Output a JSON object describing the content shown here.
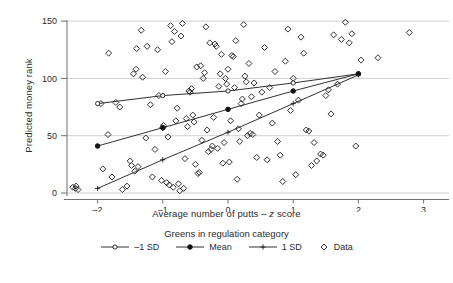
{
  "chart_data": {
    "type": "scatter",
    "title": "",
    "xlabel": "Average number of putts – z score",
    "ylabel": "Predicted money rank",
    "xlim": [
      -2.6,
      3.15
    ],
    "ylim": [
      -8,
      156
    ],
    "xticks": [
      -2,
      -1,
      0,
      1,
      2,
      3
    ],
    "xtick_labels": [
      "–2",
      "–1",
      "0",
      "1",
      "2",
      "3"
    ],
    "yticks": [
      0,
      50,
      100,
      150
    ],
    "ytick_labels": [
      "0",
      "50",
      "100",
      "150"
    ],
    "grid": "horizontal",
    "legend_position": "below",
    "legend_title": "Greens in regulation category",
    "series": [
      {
        "name": "–1 SD",
        "type": "line",
        "marker": "open-circle",
        "x": [
          -2,
          -1,
          0,
          1,
          2
        ],
        "y": [
          78,
          85,
          89,
          96,
          104
        ]
      },
      {
        "name": "Mean",
        "type": "line",
        "marker": "filled-circle",
        "x": [
          -2,
          -1,
          0,
          1,
          2
        ],
        "y": [
          41,
          57,
          73,
          89,
          104
        ]
      },
      {
        "name": "1 SD",
        "type": "line",
        "marker": "plus",
        "x": [
          -2,
          -1,
          0,
          1,
          2
        ],
        "y": [
          4,
          29,
          53,
          78,
          103
        ]
      },
      {
        "name": "Data",
        "type": "scatter",
        "marker": "open-diamond",
        "points": [
          [
            -2.38,
            5
          ],
          [
            -2.34,
            4
          ],
          [
            -2.33,
            6
          ],
          [
            -2.3,
            3
          ],
          [
            -1.95,
            78
          ],
          [
            -1.92,
            21
          ],
          [
            -1.84,
            51
          ],
          [
            -1.83,
            122
          ],
          [
            -1.78,
            14
          ],
          [
            -1.72,
            79
          ],
          [
            -1.66,
            75
          ],
          [
            -1.62,
            3
          ],
          [
            -1.55,
            6
          ],
          [
            -1.5,
            28
          ],
          [
            -1.48,
            24
          ],
          [
            -1.45,
            104
          ],
          [
            -1.43,
            19
          ],
          [
            -1.41,
            108
          ],
          [
            -1.4,
            126
          ],
          [
            -1.38,
            23
          ],
          [
            -1.33,
            142
          ],
          [
            -1.31,
            101
          ],
          [
            -1.26,
            48
          ],
          [
            -1.24,
            128
          ],
          [
            -1.19,
            77
          ],
          [
            -1.16,
            14
          ],
          [
            -1.12,
            38
          ],
          [
            -1.08,
            125
          ],
          [
            -1.06,
            85
          ],
          [
            -1.02,
            11
          ],
          [
            -1.0,
            57
          ],
          [
            -0.99,
            59
          ],
          [
            -0.96,
            106
          ],
          [
            -0.94,
            9
          ],
          [
            -0.92,
            49
          ],
          [
            -0.9,
            7
          ],
          [
            -0.88,
            146
          ],
          [
            -0.86,
            132
          ],
          [
            -0.84,
            5
          ],
          [
            -0.82,
            141
          ],
          [
            -0.8,
            63
          ],
          [
            -0.78,
            74
          ],
          [
            -0.76,
            8
          ],
          [
            -0.74,
            2
          ],
          [
            -0.72,
            137
          ],
          [
            -0.7,
            148
          ],
          [
            -0.68,
            4
          ],
          [
            -0.66,
            30
          ],
          [
            -0.64,
            65
          ],
          [
            -0.62,
            58
          ],
          [
            -0.6,
            89
          ],
          [
            -0.58,
            88
          ],
          [
            -0.56,
            91
          ],
          [
            -0.54,
            68
          ],
          [
            -0.52,
            62
          ],
          [
            -0.5,
            25
          ],
          [
            -0.48,
            110
          ],
          [
            -0.46,
            17
          ],
          [
            -0.44,
            18
          ],
          [
            -0.42,
            111
          ],
          [
            -0.4,
            46
          ],
          [
            -0.38,
            100
          ],
          [
            -0.36,
            105
          ],
          [
            -0.34,
            145
          ],
          [
            -0.32,
            55
          ],
          [
            -0.3,
            36
          ],
          [
            -0.28,
            131
          ],
          [
            -0.26,
            38
          ],
          [
            -0.24,
            41
          ],
          [
            -0.22,
            66
          ],
          [
            -0.2,
            130
          ],
          [
            -0.18,
            128
          ],
          [
            -0.16,
            39
          ],
          [
            -0.14,
            93
          ],
          [
            -0.12,
            104
          ],
          [
            -0.1,
            121
          ],
          [
            -0.08,
            26
          ],
          [
            -0.06,
            44
          ],
          [
            -0.04,
            100
          ],
          [
            -0.02,
            95
          ],
          [
            0.0,
            108
          ],
          [
            0.02,
            27
          ],
          [
            0.04,
            63
          ],
          [
            0.06,
            120
          ],
          [
            0.08,
            119
          ],
          [
            0.1,
            92
          ],
          [
            0.12,
            133
          ],
          [
            0.14,
            12
          ],
          [
            0.16,
            56
          ],
          [
            0.18,
            45
          ],
          [
            0.2,
            78
          ],
          [
            0.22,
            82
          ],
          [
            0.24,
            147
          ],
          [
            0.26,
            102
          ],
          [
            0.28,
            97
          ],
          [
            0.3,
            50
          ],
          [
            0.32,
            113
          ],
          [
            0.34,
            52
          ],
          [
            0.36,
            84
          ],
          [
            0.38,
            51
          ],
          [
            0.4,
            96
          ],
          [
            0.44,
            31
          ],
          [
            0.48,
            68
          ],
          [
            0.52,
            88
          ],
          [
            0.56,
            127
          ],
          [
            0.6,
            29
          ],
          [
            0.64,
            92
          ],
          [
            0.68,
            61
          ],
          [
            0.72,
            106
          ],
          [
            0.76,
            45
          ],
          [
            0.8,
            33
          ],
          [
            0.84,
            10
          ],
          [
            0.88,
            115
          ],
          [
            0.92,
            143
          ],
          [
            0.96,
            72
          ],
          [
            1.0,
            100
          ],
          [
            1.04,
            16
          ],
          [
            1.08,
            81
          ],
          [
            1.12,
            136
          ],
          [
            1.16,
            122
          ],
          [
            1.2,
            55
          ],
          [
            1.24,
            54
          ],
          [
            1.28,
            24
          ],
          [
            1.32,
            44
          ],
          [
            1.36,
            28
          ],
          [
            1.42,
            34
          ],
          [
            1.46,
            33
          ],
          [
            1.5,
            85
          ],
          [
            1.54,
            90
          ],
          [
            1.58,
            69
          ],
          [
            1.62,
            138
          ],
          [
            1.68,
            95
          ],
          [
            1.74,
            134
          ],
          [
            1.8,
            149
          ],
          [
            1.86,
            131
          ],
          [
            1.9,
            139
          ],
          [
            1.96,
            41
          ],
          [
            2.04,
            116
          ],
          [
            2.3,
            118
          ],
          [
            2.78,
            140
          ]
        ]
      }
    ]
  },
  "legend": {
    "title": "Greens in regulation category",
    "items": [
      {
        "label": "–1 SD",
        "marker": "open-circle"
      },
      {
        "label": "Mean",
        "marker": "filled-circle"
      },
      {
        "label": "1 SD",
        "marker": "plus"
      },
      {
        "label": "Data",
        "marker": "open-diamond"
      }
    ]
  },
  "axes": {
    "x_title_prefix": "Average number of putts – ",
    "x_title_italic": "z",
    "x_title_suffix": " score",
    "y_title": "Predicted money rank"
  }
}
